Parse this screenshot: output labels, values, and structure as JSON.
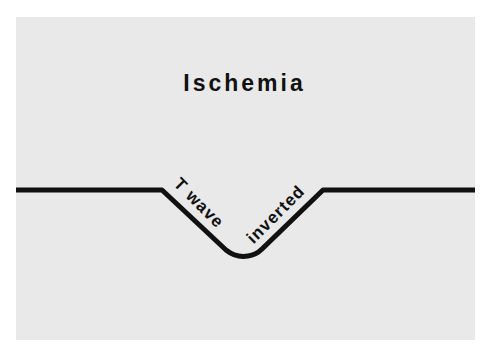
{
  "title": "Ischemia",
  "diagram": {
    "type": "ecg-waveform",
    "labels": {
      "descending": "T wave",
      "ascending": "inverted"
    },
    "colors": {
      "line": "#111111",
      "background": "#e9e9e9",
      "margin": "#ffffff"
    }
  }
}
